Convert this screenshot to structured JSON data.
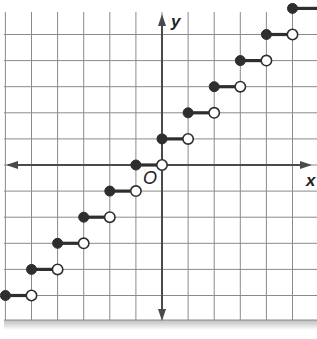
{
  "chart_data": {
    "type": "line",
    "title": "",
    "xlabel": "x",
    "ylabel": "y",
    "origin_label": "O",
    "xlim": [
      -6,
      6
    ],
    "ylim": [
      -6,
      6
    ],
    "grid": true,
    "grid_unit": 1,
    "tick_labels": false,
    "segments": [
      {
        "x_start": -6,
        "x_end": -5,
        "y": -5,
        "start": "closed",
        "end": "open"
      },
      {
        "x_start": -5,
        "x_end": -4,
        "y": -4,
        "start": "closed",
        "end": "open"
      },
      {
        "x_start": -4,
        "x_end": -3,
        "y": -3,
        "start": "closed",
        "end": "open"
      },
      {
        "x_start": -3,
        "x_end": -2,
        "y": -2,
        "start": "closed",
        "end": "open"
      },
      {
        "x_start": -2,
        "x_end": -1,
        "y": -1,
        "start": "closed",
        "end": "open"
      },
      {
        "x_start": -1,
        "x_end": 0,
        "y": 0,
        "start": "closed",
        "end": "open"
      },
      {
        "x_start": 0,
        "x_end": 1,
        "y": 1,
        "start": "closed",
        "end": "open"
      },
      {
        "x_start": 1,
        "x_end": 2,
        "y": 2,
        "start": "closed",
        "end": "open"
      },
      {
        "x_start": 2,
        "x_end": 3,
        "y": 3,
        "start": "closed",
        "end": "open"
      },
      {
        "x_start": 3,
        "x_end": 4,
        "y": 4,
        "start": "closed",
        "end": "open"
      },
      {
        "x_start": 4,
        "x_end": 5,
        "y": 5,
        "start": "closed",
        "end": "open"
      },
      {
        "x_start": 5,
        "x_end": 6,
        "y": 6,
        "start": "closed",
        "end": "continues"
      }
    ],
    "colors": {
      "grid": "#8a8a8a",
      "axis": "#4a4a4a",
      "function": "#2e2e2e",
      "open_fill": "#ffffff"
    }
  },
  "labels": {
    "x_axis": "x",
    "y_axis": "y",
    "origin": "O"
  }
}
